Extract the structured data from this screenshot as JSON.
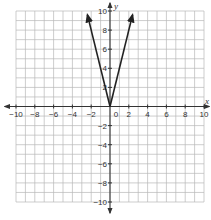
{
  "chart_data": {
    "type": "line",
    "title": "",
    "xlabel": "x",
    "ylabel": "y",
    "xlim": [
      -10,
      10
    ],
    "ylim": [
      -10,
      10
    ],
    "grid": true,
    "grid_step": 1,
    "x_ticks": [
      -10,
      -8,
      -6,
      -4,
      -2,
      0,
      2,
      4,
      6,
      8,
      10
    ],
    "y_ticks": [
      -10,
      -8,
      -6,
      -4,
      -2,
      2,
      4,
      6,
      8,
      10
    ],
    "x_tick_labels": [
      "−10",
      "−8",
      "−6",
      "−4",
      "−2",
      "0",
      "2",
      "4",
      "6",
      "8",
      "10"
    ],
    "y_tick_labels": [
      "−10",
      "−8",
      "−6",
      "−4",
      "−2",
      "2",
      "4",
      "6",
      "8",
      "10"
    ],
    "series": [
      {
        "name": "y = 4|x|",
        "points": [
          [
            -2.4,
            9.6
          ],
          [
            0,
            0
          ],
          [
            2.4,
            9.6
          ]
        ],
        "arrows": "both-ends",
        "color": "#222222"
      }
    ],
    "legend": "none"
  },
  "colors": {
    "grid": "#b8b8b8",
    "axis": "#333333",
    "line": "#222222"
  }
}
